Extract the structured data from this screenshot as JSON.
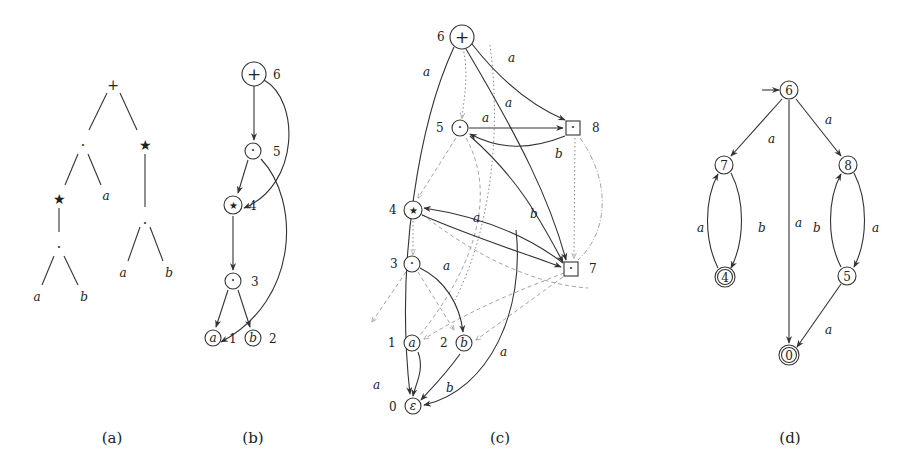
{
  "figure": {
    "captions": [
      "(a)",
      "(b)",
      "(c)",
      "(d)"
    ],
    "panel_a": {
      "description": "syntax tree",
      "nodes": {
        "root": "+",
        "concat_left": "·",
        "star_right": "★",
        "star_left": "★",
        "leaf_a_mid": "a",
        "concat_right": "·",
        "concat_deep": "·",
        "leaf_a_right": "a",
        "leaf_b_right": "b",
        "leaf_a_deep": "a",
        "leaf_b_deep": "b"
      }
    },
    "panel_b": {
      "description": "DAG with numbered nodes",
      "nodes": [
        {
          "sym": "+",
          "num": "6"
        },
        {
          "sym": "·",
          "num": "5"
        },
        {
          "sym": "★",
          "num": "4"
        },
        {
          "sym": "·",
          "num": "3"
        },
        {
          "sym": "a",
          "num": "1"
        },
        {
          "sym": "b",
          "num": "2"
        }
      ]
    },
    "panel_c": {
      "description": "automaton construction graph",
      "nodes": [
        {
          "sym": "+",
          "num": "6"
        },
        {
          "sym": "·",
          "num": "5"
        },
        {
          "sym": "·",
          "num": "8"
        },
        {
          "sym": "★",
          "num": "4"
        },
        {
          "sym": "·",
          "num": "3"
        },
        {
          "sym": "·",
          "num": "7"
        },
        {
          "sym": "a",
          "num": "1"
        },
        {
          "sym": "b",
          "num": "2"
        },
        {
          "sym": "ε",
          "num": "0"
        }
      ],
      "edge_labels": {
        "e6_0": "a",
        "e6_8": "a",
        "e6_7": "a",
        "e5_8": "a",
        "e8_5": "b",
        "e7_4": "b",
        "e4_7": "a",
        "e3_2": "a",
        "e1_0": "a",
        "e7_0": "a",
        "e2_0": "b"
      }
    },
    "panel_d": {
      "description": "resulting automaton",
      "states": [
        {
          "id": "6",
          "initial": true,
          "final": false
        },
        {
          "id": "7",
          "initial": false,
          "final": false
        },
        {
          "id": "8",
          "initial": false,
          "final": false
        },
        {
          "id": "4",
          "initial": false,
          "final": true
        },
        {
          "id": "5",
          "initial": false,
          "final": false
        },
        {
          "id": "0",
          "initial": false,
          "final": true
        }
      ],
      "transitions": [
        {
          "from": "6",
          "to": "7",
          "label": "a"
        },
        {
          "from": "6",
          "to": "8",
          "label": "a"
        },
        {
          "from": "6",
          "to": "0",
          "label": "a"
        },
        {
          "from": "7",
          "to": "4",
          "label": "b"
        },
        {
          "from": "4",
          "to": "7",
          "label": "a"
        },
        {
          "from": "8",
          "to": "5",
          "label": "a"
        },
        {
          "from": "5",
          "to": "8",
          "label": "b"
        },
        {
          "from": "5",
          "to": "0",
          "label": "a"
        }
      ]
    }
  }
}
